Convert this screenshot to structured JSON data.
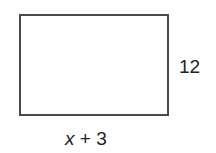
{
  "figure": {
    "shape": "rectangle",
    "side_label": "12",
    "bottom_label": {
      "variable": "x",
      "rest": " + 3"
    },
    "stroke_color": "#4a4a4a"
  }
}
